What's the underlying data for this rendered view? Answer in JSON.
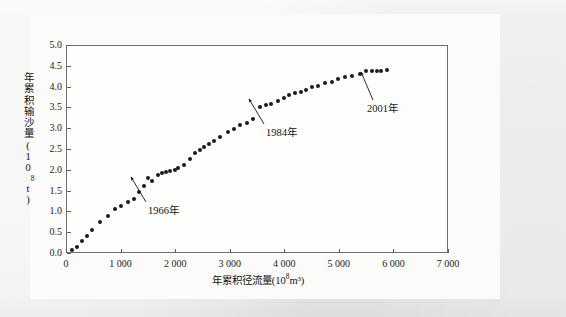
{
  "figure": {
    "kind": "scatter-double-mass-curve",
    "background_color": "#f1f1ef",
    "canvas_color": "#fbfbfa",
    "frame_color": "#6f6f6f",
    "point_color": "#1b1b1b"
  },
  "axes": {
    "x_tick_labels": [
      "0",
      "1 000",
      "2 000",
      "3 000",
      "4 000",
      "5 000",
      "6 000",
      "7 000"
    ],
    "y_tick_labels": [
      "0.0",
      "0.5",
      "1.0",
      "1.5",
      "2.0",
      "2.5",
      "3.0",
      "3.5",
      "4.0",
      "4.5",
      "5.0"
    ],
    "x_title_text": "年累积径流量(10",
    "x_title_exp": "8",
    "x_title_tail": "m³)",
    "y_title_text": "年累积输沙量(10",
    "y_title_exp": "8",
    "y_title_tail": "t)"
  },
  "annotations": [
    {
      "label": "1966年",
      "label_x": 148,
      "label_y": 205,
      "arrow_from_x": 146,
      "arrow_from_y": 202,
      "arrow_to_x": 131,
      "arrow_to_y": 177
    },
    {
      "label": "1984年",
      "label_x": 266,
      "label_y": 127,
      "arrow_from_x": 264,
      "arrow_from_y": 124,
      "arrow_to_x": 249,
      "arrow_to_y": 99
    },
    {
      "label": "2001年",
      "label_x": 367,
      "label_y": 103,
      "arrow_from_x": 373,
      "arrow_from_y": 100,
      "arrow_to_x": 361,
      "arrow_to_y": 72
    }
  ],
  "chart_data": {
    "type": "scatter",
    "title": "",
    "xlabel": "年累积径流量(10⁸m³)",
    "ylabel": "年累积输沙量(10⁸t)",
    "xlim": [
      0,
      7000
    ],
    "ylim": [
      0.0,
      5.0
    ],
    "xticks": [
      0,
      1000,
      2000,
      3000,
      4000,
      5000,
      6000,
      7000
    ],
    "yticks": [
      0.0,
      0.5,
      1.0,
      1.5,
      2.0,
      2.5,
      3.0,
      3.5,
      4.0,
      4.5,
      5.0
    ],
    "grid": false,
    "legend": "none",
    "x_label_separator": "space (thousands)",
    "series": [
      {
        "name": "年累积径流量-年累积输沙量",
        "marker": "filled-circle",
        "color": "#1b1b1b",
        "points": [
          [
            110,
            0.08
          ],
          [
            200,
            0.15
          ],
          [
            300,
            0.3
          ],
          [
            390,
            0.42
          ],
          [
            480,
            0.55
          ],
          [
            630,
            0.75
          ],
          [
            760,
            0.9
          ],
          [
            900,
            1.05
          ],
          [
            1010,
            1.12
          ],
          [
            1130,
            1.22
          ],
          [
            1240,
            1.3
          ],
          [
            1330,
            1.46
          ],
          [
            1430,
            1.62
          ],
          [
            1510,
            1.8
          ],
          [
            1580,
            1.72
          ],
          [
            1680,
            1.87
          ],
          [
            1760,
            1.93
          ],
          [
            1830,
            1.94
          ],
          [
            1910,
            1.98
          ],
          [
            1990,
            2.0
          ],
          [
            2060,
            2.05
          ],
          [
            2160,
            2.12
          ],
          [
            2270,
            2.25
          ],
          [
            2360,
            2.4
          ],
          [
            2450,
            2.48
          ],
          [
            2530,
            2.55
          ],
          [
            2620,
            2.62
          ],
          [
            2720,
            2.7
          ],
          [
            2820,
            2.8
          ],
          [
            2960,
            2.9
          ],
          [
            3080,
            2.98
          ],
          [
            3190,
            3.08
          ],
          [
            3310,
            3.12
          ],
          [
            3430,
            3.22
          ],
          [
            3560,
            3.52
          ],
          [
            3660,
            3.55
          ],
          [
            3760,
            3.58
          ],
          [
            3880,
            3.65
          ],
          [
            3990,
            3.72
          ],
          [
            4090,
            3.8
          ],
          [
            4200,
            3.85
          ],
          [
            4300,
            3.88
          ],
          [
            4400,
            3.92
          ],
          [
            4510,
            3.98
          ],
          [
            4620,
            4.02
          ],
          [
            4740,
            4.08
          ],
          [
            4870,
            4.12
          ],
          [
            4990,
            4.18
          ],
          [
            5110,
            4.22
          ],
          [
            5240,
            4.25
          ],
          [
            5380,
            4.3
          ],
          [
            5500,
            4.38
          ],
          [
            5600,
            4.38
          ],
          [
            5690,
            4.38
          ],
          [
            5770,
            4.38
          ],
          [
            5880,
            4.4
          ]
        ]
      }
    ],
    "annotated_points": [
      {
        "label": "1966年",
        "x": 1510,
        "y": 1.8
      },
      {
        "label": "1984年",
        "x": 3560,
        "y": 3.52
      },
      {
        "label": "2001年",
        "x": 5500,
        "y": 4.38
      }
    ]
  }
}
